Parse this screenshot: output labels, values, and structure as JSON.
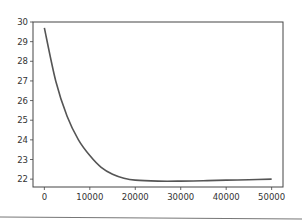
{
  "chart_data": {
    "type": "line",
    "title": "",
    "xlabel": "",
    "ylabel": "",
    "xlim": [
      -2500,
      52500
    ],
    "ylim": [
      21.6,
      30
    ],
    "grid": false,
    "legend": null,
    "x_ticks": [
      0,
      10000,
      20000,
      30000,
      40000,
      50000
    ],
    "x_tick_labels": [
      "0",
      "10000",
      "20000",
      "30000",
      "40000",
      "50000"
    ],
    "y_ticks": [
      22,
      23,
      24,
      25,
      26,
      27,
      28,
      29,
      30
    ],
    "y_tick_labels": [
      "22",
      "23",
      "24",
      "25",
      "26",
      "27",
      "28",
      "29",
      "30"
    ],
    "series": [
      {
        "name": "series-1",
        "color": "#555555",
        "x": [
          0,
          2500,
          5000,
          7500,
          10000,
          12500,
          15000,
          17500,
          20000,
          25000,
          30000,
          35000,
          40000,
          45000,
          50000
        ],
        "y": [
          29.7,
          27.0,
          25.2,
          24.0,
          23.2,
          22.6,
          22.25,
          22.05,
          21.95,
          21.9,
          21.9,
          21.92,
          21.95,
          21.97,
          22.0
        ]
      }
    ]
  },
  "colors": {
    "axes": "#444444",
    "line": "#555555",
    "background": "#ffffff"
  }
}
